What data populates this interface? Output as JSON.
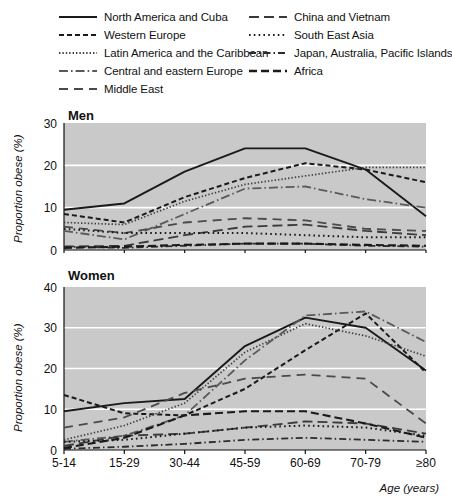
{
  "legend": {
    "items": [
      {
        "label": "North America and Cuba",
        "key": "na_cuba",
        "dash": "none",
        "color": "#1a1a1a",
        "width": 1.9
      },
      {
        "label": "China and Vietnam",
        "key": "china_vietnam",
        "dash": "10,5",
        "color": "#3a3a3a",
        "width": 1.8
      },
      {
        "label": "Western Europe",
        "key": "western_europe",
        "dash": "5,3",
        "color": "#1a1a1a",
        "width": 2.0
      },
      {
        "label": "South East Asia",
        "key": "south_east_asia",
        "dash": "1.6,3.2",
        "color": "#1a1a1a",
        "width": 2.0
      },
      {
        "label": "Latin America and the Caribbean",
        "key": "latin_america",
        "dash": "1.4,2.0",
        "color": "#404040",
        "width": 1.7
      },
      {
        "label": "Japan, Australia, Pacific Islands",
        "key": "japan_aus_pacific",
        "dash": "7,3,1.5,3",
        "color": "#2b2b2b",
        "width": 1.8
      },
      {
        "label": "Central and eastern Europe",
        "key": "central_eastern_europe",
        "dash": "9,3,1.6,3",
        "color": "#5a5a5a",
        "width": 1.8
      },
      {
        "label": "Africa",
        "key": "africa",
        "dash": "8,4",
        "color": "#1a1a1a",
        "width": 2.1
      },
      {
        "label": "Middle East",
        "key": "middle_east",
        "dash": "9,6",
        "color": "#4a4a4a",
        "width": 1.8
      }
    ],
    "column_order": [
      "na_cuba",
      "western_europe",
      "latin_america",
      "central_eastern_europe",
      "middle_east",
      "china_vietnam",
      "south_east_asia",
      "japan_aus_pacific",
      "africa"
    ]
  },
  "axes": {
    "x_label": "Age (years)",
    "y_label": "Proportion obese (%)",
    "categories": [
      "5-14",
      "15-29",
      "30-44",
      "45-59",
      "60-69",
      "70-79",
      "≥80"
    ]
  },
  "panels": {
    "men": {
      "title": "Men",
      "y_ticks": [
        "0",
        "10",
        "20",
        "30"
      ],
      "y_min": 0,
      "y_max": 30
    },
    "women": {
      "title": "Women",
      "y_ticks": [
        "0",
        "10",
        "20",
        "30",
        "40"
      ],
      "y_min": 0,
      "y_max": 40
    }
  },
  "chart_data": [
    {
      "type": "line",
      "title": "Men",
      "xlabel": "Age (years)",
      "ylabel": "Proportion obese (%)",
      "categories": [
        "5-14",
        "15-29",
        "30-44",
        "45-59",
        "60-69",
        "70-79",
        "≥80"
      ],
      "ylim": [
        0,
        30
      ],
      "yticks": [
        0,
        10,
        20,
        30
      ],
      "grid": true,
      "legend_position": "top",
      "series": [
        {
          "name": "North America and Cuba",
          "key": "na_cuba",
          "values": [
            9.5,
            11.0,
            18.5,
            24.0,
            24.0,
            19.0,
            8.0
          ]
        },
        {
          "name": "Western Europe",
          "key": "western_europe",
          "values": [
            8.5,
            6.5,
            12.5,
            17.0,
            20.5,
            19.0,
            16.0
          ]
        },
        {
          "name": "Latin America and the Caribbean",
          "key": "latin_america",
          "values": [
            6.5,
            6.0,
            11.5,
            15.5,
            17.5,
            19.5,
            19.5
          ]
        },
        {
          "name": "Central and eastern Europe",
          "key": "central_eastern_europe",
          "values": [
            4.5,
            2.5,
            8.5,
            14.5,
            15.0,
            12.0,
            10.0
          ]
        },
        {
          "name": "Middle East",
          "key": "middle_east",
          "values": [
            5.5,
            4.0,
            6.5,
            7.5,
            7.0,
            5.0,
            4.5
          ]
        },
        {
          "name": "China and Vietnam",
          "key": "china_vietnam",
          "values": [
            0.8,
            1.0,
            3.5,
            5.5,
            6.0,
            4.5,
            3.5
          ]
        },
        {
          "name": "South East Asia",
          "key": "south_east_asia",
          "values": [
            5.0,
            4.0,
            4.0,
            4.0,
            3.5,
            3.0,
            3.0
          ]
        },
        {
          "name": "Japan, Australia, Pacific Islands",
          "key": "japan_aus_pacific",
          "values": [
            0.8,
            0.5,
            1.0,
            1.5,
            1.5,
            1.0,
            0.8
          ]
        },
        {
          "name": "Africa",
          "key": "africa",
          "values": [
            0.5,
            0.8,
            1.2,
            1.5,
            1.5,
            1.2,
            1.0
          ]
        }
      ]
    },
    {
      "type": "line",
      "title": "Women",
      "xlabel": "Age (years)",
      "ylabel": "Proportion obese (%)",
      "categories": [
        "5-14",
        "15-29",
        "30-44",
        "45-59",
        "60-69",
        "70-79",
        "≥80"
      ],
      "ylim": [
        0,
        40
      ],
      "yticks": [
        0,
        10,
        20,
        30,
        40
      ],
      "grid": true,
      "legend_position": "top",
      "series": [
        {
          "name": "North America and Cuba",
          "key": "na_cuba",
          "values": [
            9.5,
            11.5,
            12.5,
            25.5,
            32.5,
            30.0,
            19.5
          ]
        },
        {
          "name": "Western Europe",
          "key": "western_europe",
          "values": [
            13.5,
            9.0,
            8.5,
            15.0,
            24.5,
            33.5,
            19.0
          ]
        },
        {
          "name": "Latin America and the Caribbean",
          "key": "latin_america",
          "values": [
            2.5,
            6.0,
            11.5,
            24.0,
            31.0,
            28.0,
            23.0
          ]
        },
        {
          "name": "Central and eastern Europe",
          "key": "central_eastern_europe",
          "values": [
            2.0,
            3.5,
            8.5,
            22.0,
            33.0,
            34.0,
            26.5
          ]
        },
        {
          "name": "Middle East",
          "key": "middle_east",
          "values": [
            5.5,
            8.0,
            14.0,
            17.5,
            18.5,
            17.5,
            6.5
          ]
        },
        {
          "name": "China and Vietnam",
          "key": "china_vietnam",
          "values": [
            1.0,
            3.5,
            4.0,
            5.5,
            7.0,
            6.5,
            4.0
          ]
        },
        {
          "name": "South East Asia",
          "key": "south_east_asia",
          "values": [
            2.0,
            2.5,
            4.0,
            5.5,
            6.0,
            5.5,
            3.5
          ]
        },
        {
          "name": "Japan, Australia, Pacific Islands",
          "key": "japan_aus_pacific",
          "values": [
            0.3,
            0.8,
            1.5,
            2.5,
            3.0,
            2.5,
            2.0
          ]
        },
        {
          "name": "Africa",
          "key": "africa",
          "values": [
            0.5,
            3.0,
            8.5,
            9.5,
            9.5,
            6.5,
            3.0
          ]
        }
      ]
    }
  ]
}
